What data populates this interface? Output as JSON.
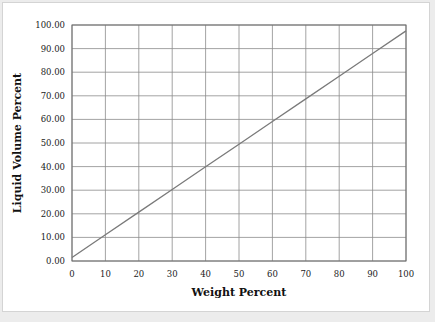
{
  "chart_data": {
    "type": "line",
    "title": "",
    "xlabel": "Weight Percent",
    "ylabel": "Liquid Volume Percent",
    "xlim": [
      0,
      100
    ],
    "ylim": [
      0,
      100
    ],
    "grid": true,
    "legend": null,
    "x_ticks": [
      "0",
      "10",
      "20",
      "30",
      "40",
      "50",
      "60",
      "70",
      "80",
      "90",
      "100"
    ],
    "y_ticks": [
      "0.00",
      "10.00",
      "20.00",
      "30.00",
      "40.00",
      "50.00",
      "60.00",
      "70.00",
      "80.00",
      "90.00",
      "100.00"
    ],
    "series": [
      {
        "name": "Liquid Volume Percent vs Weight Percent",
        "x": [
          0,
          10,
          20,
          30,
          40,
          50,
          60,
          70,
          80,
          90,
          100
        ],
        "y": [
          1.5,
          11.1,
          20.7,
          30.3,
          39.9,
          49.5,
          59.1,
          68.7,
          78.3,
          87.9,
          97.5
        ]
      }
    ],
    "colors": {
      "line": "#7a7a7a",
      "grid": "#8c8c8c",
      "frame": "#6e6e6e"
    }
  }
}
